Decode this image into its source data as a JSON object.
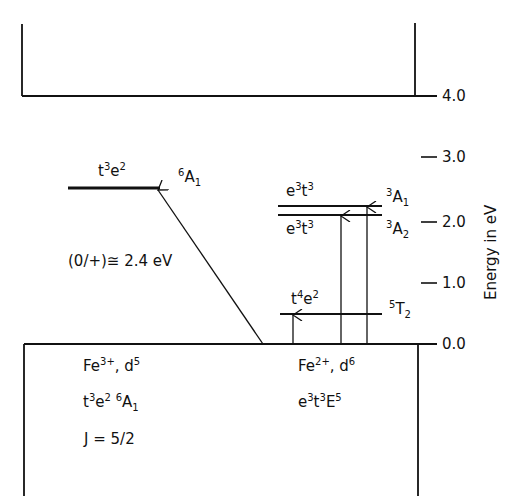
{
  "diagram": {
    "type": "energy-level-diagram",
    "axis": {
      "title": "Energy in eV",
      "ticks": [
        {
          "value": "4.0",
          "y": 96
        },
        {
          "value": "3.0",
          "y": 157
        },
        {
          "value": "2.0",
          "y": 222
        },
        {
          "value": "1.0",
          "y": 283
        },
        {
          "value": "0.0",
          "y": 344
        }
      ]
    },
    "fe3": {
      "level_config": "t",
      "level_config_sup1": "3",
      "level_config_e": "e",
      "level_config_sup2": "2",
      "term_sup": "6",
      "term": "A",
      "term_sub": "1",
      "transition_label": "(0/+)≅ 2.4 eV",
      "ground_ion": "Fe",
      "ground_ion_charge": "3+",
      "ground_config": ", d",
      "ground_config_sup": "5",
      "ground_term_t": "t",
      "ground_term_t_sup": "3",
      "ground_term_e": "e",
      "ground_term_e_sup": "2",
      "ground_term_sup": "6",
      "ground_term": "A",
      "ground_term_sub": "1",
      "j_label": "J = 5/2"
    },
    "fe2": {
      "upper1_e": "e",
      "upper1_e_sup": "3",
      "upper1_t": "t",
      "upper1_t_sup": "3",
      "upper1_term_sup": "3",
      "upper1_term": "A",
      "upper1_term_sub": "1",
      "upper2_e": "e",
      "upper2_e_sup": "3",
      "upper2_t": "t",
      "upper2_t_sup": "3",
      "upper2_term_sup": "3",
      "upper2_term": "A",
      "upper2_term_sub": "2",
      "mid_t": "t",
      "mid_t_sup": "4",
      "mid_e": "e",
      "mid_e_sup": "2",
      "mid_term_sup": "5",
      "mid_term": "T",
      "mid_term_sub": "2",
      "ground_ion": "Fe",
      "ground_ion_charge": "2+",
      "ground_config": ", d",
      "ground_config_sup": "6",
      "ground_e": "e",
      "ground_e_sup": "3",
      "ground_t": "t",
      "ground_t_sup": "3",
      "ground_term": "E",
      "ground_term_sup": "5"
    },
    "levels_eV": {
      "conduction_band_edge": 4.0,
      "fe3_6A1": 2.4,
      "fe2_3A1": 2.2,
      "fe2_3A2": 2.05,
      "fe2_5T2": 0.5,
      "valence_band_edge": 0.0
    }
  }
}
